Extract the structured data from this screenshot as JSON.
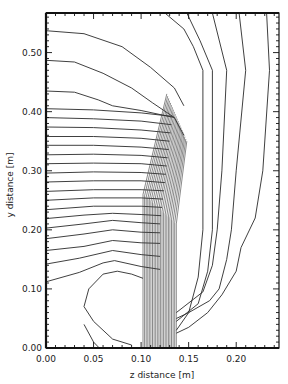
{
  "chart_data": {
    "type": "contour",
    "title": "",
    "xlabel": "z distance [m]",
    "ylabel": "y distance [m]",
    "xlim": [
      0.0,
      0.245
    ],
    "ylim": [
      0.0,
      0.567
    ],
    "grid": false,
    "legend": null,
    "x_ticks": [
      {
        "value": 0.0,
        "label": "0.00"
      },
      {
        "value": 0.05,
        "label": "0.05"
      },
      {
        "value": 0.1,
        "label": "0.10"
      },
      {
        "value": 0.15,
        "label": "0.15"
      },
      {
        "value": 0.2,
        "label": "0.20"
      }
    ],
    "y_ticks": [
      {
        "value": 0.0,
        "label": "0.00"
      },
      {
        "value": 0.1,
        "label": "0.10"
      },
      {
        "value": 0.2,
        "label": "0.20"
      },
      {
        "value": 0.3,
        "label": "0.30"
      },
      {
        "value": 0.4,
        "label": "0.40"
      },
      {
        "value": 0.5,
        "label": "0.50"
      }
    ],
    "x_minor_step": 0.01,
    "y_minor_step": 0.01,
    "dense_band": {
      "z_start": 0.102,
      "z_end": 0.137,
      "y_top": 0.43,
      "line_count": 22
    },
    "contours": [
      {
        "points": [
          [
            0.0,
            0.537
          ],
          [
            0.04,
            0.532
          ],
          [
            0.08,
            0.51
          ],
          [
            0.11,
            0.475
          ],
          [
            0.135,
            0.44
          ],
          [
            0.145,
            0.41
          ]
        ]
      },
      {
        "points": [
          [
            0.0,
            0.487
          ],
          [
            0.03,
            0.484
          ],
          [
            0.06,
            0.465
          ],
          [
            0.09,
            0.44
          ],
          [
            0.112,
            0.415
          ],
          [
            0.135,
            0.39
          ],
          [
            0.145,
            0.36
          ]
        ]
      },
      {
        "points": [
          [
            0.0,
            0.435
          ],
          [
            0.03,
            0.433
          ],
          [
            0.055,
            0.42
          ],
          [
            0.07,
            0.41
          ],
          [
            0.1,
            0.402
          ],
          [
            0.135,
            0.39
          ]
        ]
      },
      {
        "points": [
          [
            0.0,
            0.405
          ],
          [
            0.05,
            0.403
          ],
          [
            0.1,
            0.398
          ],
          [
            0.133,
            0.392
          ]
        ]
      },
      {
        "points": [
          [
            0.0,
            0.39
          ],
          [
            0.05,
            0.388
          ],
          [
            0.1,
            0.384
          ],
          [
            0.132,
            0.378
          ]
        ]
      },
      {
        "points": [
          [
            0.0,
            0.374
          ],
          [
            0.05,
            0.373
          ],
          [
            0.1,
            0.369
          ],
          [
            0.131,
            0.364
          ]
        ]
      },
      {
        "points": [
          [
            0.0,
            0.358
          ],
          [
            0.05,
            0.358
          ],
          [
            0.1,
            0.355
          ],
          [
            0.13,
            0.35
          ]
        ]
      },
      {
        "points": [
          [
            0.0,
            0.343
          ],
          [
            0.05,
            0.343
          ],
          [
            0.1,
            0.34
          ],
          [
            0.129,
            0.336
          ]
        ]
      },
      {
        "points": [
          [
            0.0,
            0.327
          ],
          [
            0.05,
            0.328
          ],
          [
            0.1,
            0.326
          ],
          [
            0.128,
            0.322
          ]
        ]
      },
      {
        "points": [
          [
            0.0,
            0.312
          ],
          [
            0.05,
            0.313
          ],
          [
            0.1,
            0.312
          ],
          [
            0.127,
            0.308
          ]
        ]
      },
      {
        "points": [
          [
            0.0,
            0.296
          ],
          [
            0.05,
            0.298
          ],
          [
            0.1,
            0.297
          ],
          [
            0.126,
            0.294
          ]
        ]
      },
      {
        "points": [
          [
            0.0,
            0.281
          ],
          [
            0.05,
            0.283
          ],
          [
            0.1,
            0.283
          ],
          [
            0.125,
            0.28
          ]
        ]
      },
      {
        "points": [
          [
            0.0,
            0.265
          ],
          [
            0.05,
            0.268
          ],
          [
            0.1,
            0.268
          ],
          [
            0.124,
            0.266
          ]
        ]
      },
      {
        "points": [
          [
            0.0,
            0.25
          ],
          [
            0.05,
            0.254
          ],
          [
            0.1,
            0.254
          ],
          [
            0.123,
            0.252
          ]
        ]
      },
      {
        "points": [
          [
            0.0,
            0.234
          ],
          [
            0.05,
            0.24
          ],
          [
            0.1,
            0.24
          ],
          [
            0.122,
            0.238
          ]
        ]
      },
      {
        "points": [
          [
            0.0,
            0.219
          ],
          [
            0.04,
            0.225
          ],
          [
            0.07,
            0.228
          ],
          [
            0.1,
            0.226
          ],
          [
            0.121,
            0.224
          ]
        ]
      },
      {
        "points": [
          [
            0.0,
            0.203
          ],
          [
            0.04,
            0.21
          ],
          [
            0.07,
            0.216
          ],
          [
            0.1,
            0.212
          ],
          [
            0.12,
            0.21
          ]
        ]
      },
      {
        "points": [
          [
            0.0,
            0.185
          ],
          [
            0.04,
            0.193
          ],
          [
            0.07,
            0.2
          ],
          [
            0.1,
            0.196
          ],
          [
            0.12,
            0.195
          ]
        ]
      },
      {
        "points": [
          [
            0.0,
            0.165
          ],
          [
            0.04,
            0.172
          ],
          [
            0.07,
            0.182
          ],
          [
            0.1,
            0.178
          ],
          [
            0.12,
            0.177
          ]
        ]
      },
      {
        "points": [
          [
            0.0,
            0.142
          ],
          [
            0.035,
            0.152
          ],
          [
            0.07,
            0.165
          ],
          [
            0.1,
            0.158
          ],
          [
            0.12,
            0.155
          ]
        ]
      },
      {
        "points": [
          [
            0.0,
            0.112
          ],
          [
            0.035,
            0.128
          ],
          [
            0.06,
            0.144
          ],
          [
            0.072,
            0.148
          ],
          [
            0.1,
            0.138
          ],
          [
            0.12,
            0.133
          ]
        ]
      },
      {
        "points": [
          [
            0.056,
            0.0
          ],
          [
            0.05,
            0.01
          ],
          [
            0.04,
            0.04
          ]
        ]
      },
      {
        "points": [
          [
            0.09,
            0.005
          ],
          [
            0.07,
            0.015
          ],
          [
            0.05,
            0.045
          ],
          [
            0.04,
            0.07
          ],
          [
            0.045,
            0.1
          ],
          [
            0.06,
            0.125
          ],
          [
            0.075,
            0.13
          ],
          [
            0.09,
            0.125
          ],
          [
            0.102,
            0.118
          ]
        ]
      },
      {
        "points": [
          [
            0.125,
            0.567
          ],
          [
            0.145,
            0.54
          ],
          [
            0.155,
            0.51
          ],
          [
            0.165,
            0.47
          ],
          [
            0.165,
            0.2
          ],
          [
            0.16,
            0.12
          ],
          [
            0.15,
            0.06
          ],
          [
            0.137,
            0.03
          ]
        ]
      },
      {
        "points": [
          [
            0.148,
            0.567
          ],
          [
            0.162,
            0.52
          ],
          [
            0.175,
            0.47
          ],
          [
            0.175,
            0.2
          ],
          [
            0.17,
            0.13
          ],
          [
            0.16,
            0.075
          ],
          [
            0.137,
            0.045
          ]
        ]
      },
      {
        "points": [
          [
            0.175,
            0.567
          ],
          [
            0.19,
            0.47
          ],
          [
            0.185,
            0.3
          ],
          [
            0.18,
            0.2
          ],
          [
            0.175,
            0.14
          ],
          [
            0.165,
            0.095
          ],
          [
            0.137,
            0.06
          ]
        ]
      },
      {
        "points": [
          [
            0.203,
            0.567
          ],
          [
            0.21,
            0.47
          ],
          [
            0.2,
            0.3
          ],
          [
            0.195,
            0.2
          ],
          [
            0.19,
            0.15
          ],
          [
            0.182,
            0.1
          ],
          [
            0.172,
            0.08
          ],
          [
            0.15,
            0.06
          ],
          [
            0.137,
            0.05
          ]
        ]
      },
      {
        "points": [
          [
            0.232,
            0.567
          ],
          [
            0.235,
            0.47
          ],
          [
            0.228,
            0.3
          ],
          [
            0.22,
            0.22
          ],
          [
            0.205,
            0.17
          ],
          [
            0.2,
            0.13
          ],
          [
            0.185,
            0.09
          ],
          [
            0.17,
            0.06
          ],
          [
            0.15,
            0.035
          ],
          [
            0.137,
            0.025
          ]
        ]
      }
    ]
  }
}
